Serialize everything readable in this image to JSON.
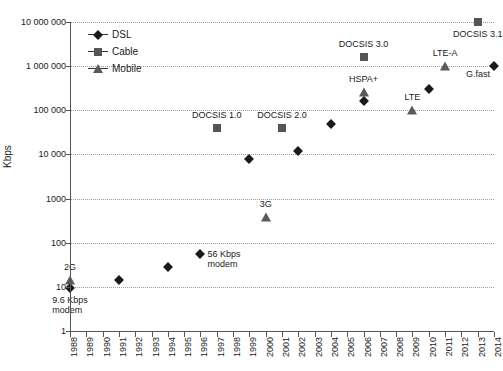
{
  "chart_data": {
    "type": "scatter",
    "title": "",
    "xlabel": "",
    "ylabel": "Kbps",
    "yscale": "log",
    "ylim": [
      1,
      10000000
    ],
    "xlim": [
      1988,
      2014
    ],
    "grid": true,
    "legend_position": "top-left",
    "y_tick_labels": [
      "10 000 000",
      "1 000 000",
      "100 000",
      "10 000",
      "1000",
      "100",
      "10",
      "1"
    ],
    "y_tick_values": [
      10000000,
      1000000,
      100000,
      10000,
      1000,
      100,
      10,
      1
    ],
    "x_tick_labels": [
      "1988",
      "1989",
      "1990",
      "1991",
      "1992",
      "1993",
      "1994",
      "1995",
      "1996",
      "1997",
      "1998",
      "1999",
      "2000",
      "2001",
      "2002",
      "2003",
      "2004",
      "2005",
      "2006",
      "2007",
      "2008",
      "2009",
      "2010",
      "2011",
      "2012",
      "2013",
      "2014"
    ],
    "legend": [
      {
        "name": "DSL",
        "marker": "diamond",
        "color": "#1a1a1a"
      },
      {
        "name": "Cable",
        "marker": "square",
        "color": "#555555"
      },
      {
        "name": "Mobile",
        "marker": "triangle",
        "color": "#5a5a5a"
      }
    ],
    "series": [
      {
        "name": "DSL",
        "marker": "diamond",
        "points": [
          {
            "x": 1988,
            "y": 9.6,
            "label": "9.6 Kbps\nmodem",
            "label_pos": "below"
          },
          {
            "x": 1991,
            "y": 14.4,
            "label": "",
            "label_pos": "none"
          },
          {
            "x": 1994,
            "y": 28.8,
            "label": "",
            "label_pos": "none"
          },
          {
            "x": 1996,
            "y": 56,
            "label": "56 Kbps\nmodem",
            "label_pos": "right"
          },
          {
            "x": 1999,
            "y": 8000,
            "label": "",
            "label_pos": "none"
          },
          {
            "x": 2002,
            "y": 12000,
            "label": "",
            "label_pos": "none"
          },
          {
            "x": 2004,
            "y": 50000,
            "label": "",
            "label_pos": "none"
          },
          {
            "x": 2006,
            "y": 160000,
            "label": "",
            "label_pos": "none"
          },
          {
            "x": 2010,
            "y": 300000,
            "label": "",
            "label_pos": "none"
          },
          {
            "x": 2014,
            "y": 1000000,
            "label": "G.fast",
            "label_pos": "below-left"
          }
        ]
      },
      {
        "name": "Cable",
        "marker": "square",
        "points": [
          {
            "x": 1997,
            "y": 40000,
            "label": "DOCSIS 1.0",
            "label_pos": "above"
          },
          {
            "x": 2001,
            "y": 40000,
            "label": "DOCSIS 2.0",
            "label_pos": "above"
          },
          {
            "x": 2006,
            "y": 1600000,
            "label": "DOCSIS 3.0",
            "label_pos": "above"
          },
          {
            "x": 2013,
            "y": 10000000,
            "label": "DOCSIS 3.1",
            "label_pos": "below"
          }
        ]
      },
      {
        "name": "Mobile",
        "marker": "triangle",
        "points": [
          {
            "x": 1988,
            "y": 14.4,
            "label": "2G",
            "label_pos": "above"
          },
          {
            "x": 2000,
            "y": 384,
            "label": "3G",
            "label_pos": "above"
          },
          {
            "x": 2006,
            "y": 260000,
            "label": "HSPA+",
            "label_pos": "above"
          },
          {
            "x": 2009,
            "y": 100000,
            "label": "LTE",
            "label_pos": "above"
          },
          {
            "x": 2011,
            "y": 1000000,
            "label": "LTE-A",
            "label_pos": "above"
          }
        ]
      }
    ]
  }
}
